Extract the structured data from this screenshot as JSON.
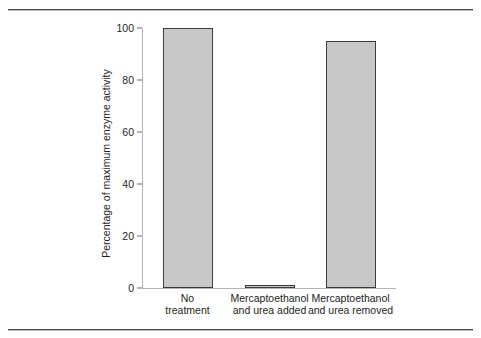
{
  "figure": {
    "background": "#ffffff",
    "rule_color": "#4a4a4f",
    "bar_fill": "#c8c8c8",
    "bar_stroke": "#3b3b3f",
    "axis_color": "#b4b4b8",
    "text_color": "#231f20"
  },
  "chart_data": {
    "type": "bar",
    "title": "",
    "xlabel": "",
    "ylabel": "Percentage of maximum enzyme activity",
    "ylim": [
      0,
      100
    ],
    "yticks": [
      0,
      20,
      40,
      60,
      80,
      100
    ],
    "ytick_labels": [
      "0",
      "20",
      "40",
      "60",
      "80",
      "100"
    ],
    "grid": false,
    "legend": false,
    "categories": [
      "No treatment",
      "Mercaptoethanol and urea added",
      "Mercaptoethanol and urea removed"
    ],
    "category_lines": [
      [
        "No",
        "treatment"
      ],
      [
        "Mercaptoethanol",
        "and urea added"
      ],
      [
        "Mercaptoethanol",
        "and urea removed"
      ]
    ],
    "values": [
      100,
      1,
      95
    ]
  }
}
